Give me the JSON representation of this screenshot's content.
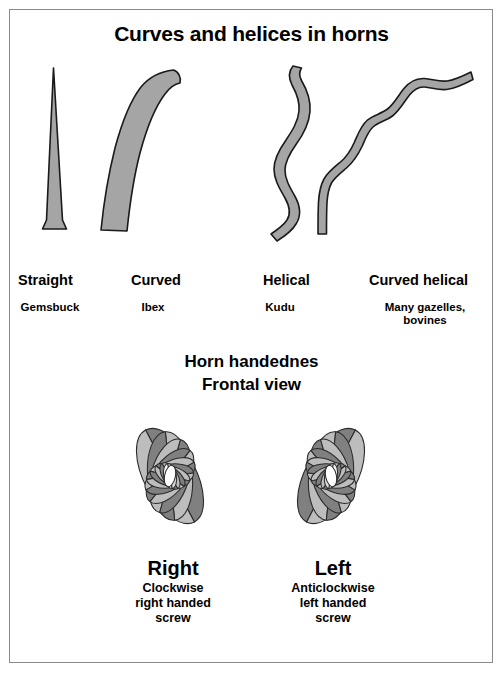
{
  "figure": {
    "title": "Curves and helices in horns",
    "frame_border_color": "#8a8a8a",
    "background_color": "#ffffff"
  },
  "horn_types": [
    {
      "label": "Straight",
      "species": "Gemsbuck",
      "shape": "straight-cone-horn"
    },
    {
      "label": "Curved",
      "species": "Ibex",
      "shape": "curved-horn"
    },
    {
      "label": "Helical",
      "species": "Kudu",
      "shape": "helical-horn"
    },
    {
      "label": "Curved helical",
      "species": "Many gazelles,\nbovines",
      "species_line1": "Many gazelles,",
      "species_line2": "bovines",
      "shape": "curved-helical-horn"
    }
  ],
  "handedness_section": {
    "heading_line1": "Horn handednes",
    "heading_line2": "Frontal view",
    "items": [
      {
        "title": "Right",
        "desc_line1": "Clockwise",
        "desc_line2": "right handed",
        "desc_line3": "screw",
        "spiral": "right-handed-spiral"
      },
      {
        "title": "Left",
        "desc_line1": "Anticlockwise",
        "desc_line2": "left handed",
        "desc_line3": "screw",
        "spiral": "left-handed-spiral"
      }
    ]
  },
  "colors": {
    "horn_fill": "#a5a5a5",
    "horn_outline": "#1a1a1a",
    "spiral_dark": "#808080",
    "spiral_light": "#bdbdbd",
    "spiral_outline": "#2a2a2a",
    "text": "#000000"
  }
}
